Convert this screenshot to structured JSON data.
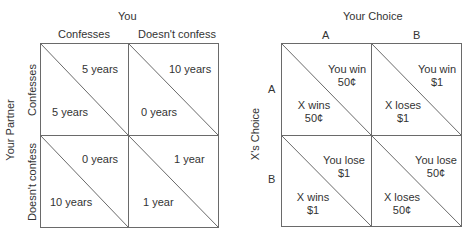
{
  "left_matrix": {
    "title": "Prisoner's dilemma payoff matrix",
    "column_player_label": "You",
    "column_headers": [
      "Confesses",
      "Doesn't confess"
    ],
    "row_player_label": "Your Partner",
    "row_headers": [
      "Confesses",
      "Doesn't confess"
    ],
    "cells": [
      [
        {
          "upper_right": "5 years",
          "lower_left": "5 years"
        },
        {
          "upper_right": "10 years",
          "lower_left": "0 years"
        }
      ],
      [
        {
          "upper_right": "0 years",
          "lower_left": "10 years"
        },
        {
          "upper_right": "1 year",
          "lower_left": "1 year"
        }
      ]
    ]
  },
  "right_matrix": {
    "column_player_label": "Your Choice",
    "column_headers": [
      "A",
      "B"
    ],
    "row_player_label": "X's Choice",
    "row_headers": [
      "A",
      "B"
    ],
    "cells": [
      [
        {
          "upper_right": [
            "You win",
            "50¢"
          ],
          "lower_left": [
            "X wins",
            "50¢"
          ]
        },
        {
          "upper_right": [
            "You win",
            "$1"
          ],
          "lower_left": [
            "X loses",
            "$1"
          ]
        }
      ],
      [
        {
          "upper_right": [
            "You lose",
            "$1"
          ],
          "lower_left": [
            "X wins",
            "$1"
          ]
        },
        {
          "upper_right": [
            "You lose",
            "50¢"
          ],
          "lower_left": [
            "X loses",
            "50¢"
          ]
        }
      ]
    ]
  },
  "colors": {
    "line": "#6a6a6a",
    "text": "#333333"
  }
}
